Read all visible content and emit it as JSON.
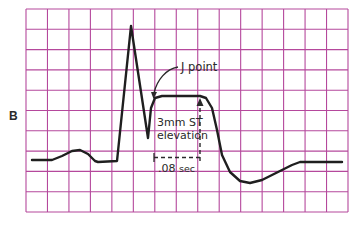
{
  "figure": {
    "panel_label": "B",
    "colors": {
      "grid": "#b5489c",
      "trace": "#1f1f1f",
      "text": "#2a2a2a",
      "background": "#ffffff"
    },
    "grid": {
      "left": 26,
      "top": 9,
      "right": 348,
      "bottom": 212,
      "columns": 15,
      "rows": 10
    },
    "annotations": {
      "j_point": "J point",
      "st_elevation_line1": "3mm ST",
      "st_elevation_line2": "elevation",
      "duration_value": ".08",
      "duration_unit": "sec"
    },
    "trace_points": [
      [
        32,
        160
      ],
      [
        52,
        160
      ],
      [
        62,
        156
      ],
      [
        72,
        151
      ],
      [
        80,
        150
      ],
      [
        88,
        154
      ],
      [
        95,
        161
      ],
      [
        98,
        162
      ],
      [
        117,
        161
      ],
      [
        131,
        26
      ],
      [
        148,
        138
      ],
      [
        151,
        108
      ],
      [
        155,
        98
      ],
      [
        162,
        96
      ],
      [
        200,
        96
      ],
      [
        206,
        98
      ],
      [
        212,
        108
      ],
      [
        217,
        130
      ],
      [
        222,
        155
      ],
      [
        230,
        172
      ],
      [
        240,
        181
      ],
      [
        250,
        183
      ],
      [
        262,
        180
      ],
      [
        278,
        172
      ],
      [
        292,
        165
      ],
      [
        300,
        162
      ],
      [
        342,
        162
      ]
    ]
  },
  "chart_data": {
    "type": "line",
    "panel": "B",
    "annotations": [
      "J point",
      "3mm ST elevation",
      ".08 sec"
    ],
    "st_elevation_mm": 3,
    "measurement_interval_sec": 0.08,
    "grid": true
  }
}
